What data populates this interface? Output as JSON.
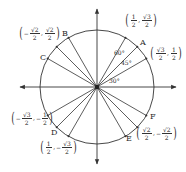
{
  "diagram": {
    "title": "",
    "type": "unit-circle",
    "center": [
      97,
      87
    ],
    "radius": 57,
    "colors": {
      "stroke": "#333333",
      "text": "#2a2a2a",
      "background": "#ffffff"
    },
    "axes": {
      "x": {
        "from": 20,
        "to": 176,
        "arrows": "both"
      },
      "y": {
        "from": 9,
        "to": 164,
        "arrows": "both"
      }
    },
    "rays_deg": [
      30,
      45,
      60,
      120,
      135,
      150,
      210,
      225,
      240,
      300,
      315,
      330
    ],
    "angle_labels": [
      {
        "text": "60°",
        "x": 114,
        "y": 50
      },
      {
        "text": "45°",
        "x": 121,
        "y": 60
      },
      {
        "text": "30°",
        "x": 109,
        "y": 78
      }
    ],
    "point_letters": [
      {
        "letter": "A",
        "angle_deg": 45,
        "x": 140,
        "y": 39
      },
      {
        "letter": "B",
        "angle_deg": 120,
        "x": 62,
        "y": 30
      },
      {
        "letter": "C",
        "angle_deg": 150,
        "x": 40,
        "y": 54
      },
      {
        "letter": "D",
        "angle_deg": 225,
        "x": 51,
        "y": 129
      },
      {
        "letter": "E",
        "angle_deg": 300,
        "x": 126,
        "y": 135
      },
      {
        "letter": "F",
        "angle_deg": 330,
        "x": 150,
        "y": 113
      }
    ],
    "coordinate_labels": [
      {
        "angle_deg": 60,
        "x_sign": "",
        "x_num": "1",
        "x_den": "2",
        "y_sign": "",
        "y_num": "√3",
        "y_den": "2",
        "pos": [
          124,
          13
        ]
      },
      {
        "angle_deg": 30,
        "x_sign": "",
        "x_num": "√3",
        "x_den": "2",
        "y_sign": "",
        "y_num": "1",
        "y_den": "2",
        "pos": [
          149,
          46
        ]
      },
      {
        "angle_deg": 135,
        "x_sign": "−",
        "x_num": "√2",
        "x_den": "2",
        "y_sign": "",
        "y_num": "√2",
        "y_den": "2",
        "pos": [
          18,
          26
        ]
      },
      {
        "angle_deg": 210,
        "x_sign": "−",
        "x_num": "√3",
        "x_den": "2",
        "y_sign": "−",
        "y_num": "1",
        "y_den": "2",
        "pos": [
          10,
          111
        ]
      },
      {
        "angle_deg": 240,
        "x_sign": "",
        "x_num": "1",
        "x_den": "2",
        "y_sign": "−",
        "y_num": "√3",
        "y_den": "2",
        "pos": [
          39,
          140
        ]
      },
      {
        "angle_deg": 315,
        "x_sign": "",
        "x_num": "√2",
        "x_den": "2",
        "y_sign": "−",
        "y_num": "√2",
        "y_den": "2",
        "pos": [
          135,
          126
        ]
      }
    ]
  }
}
